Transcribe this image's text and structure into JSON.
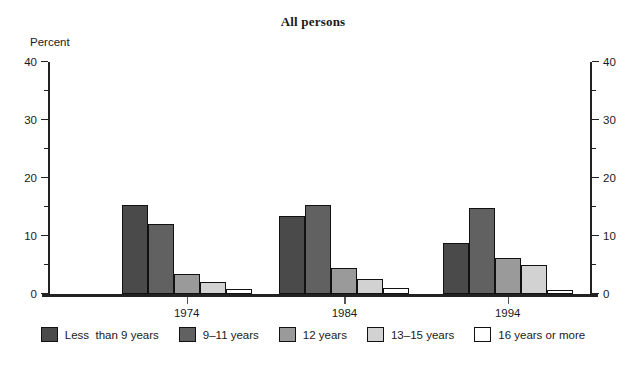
{
  "chart_data": {
    "type": "bar",
    "title": "All persons",
    "xlabel": "",
    "ylabel": "Percent",
    "ylim": [
      0,
      40
    ],
    "yticks": [
      0,
      10,
      20,
      30,
      40
    ],
    "yminorticks": [
      5,
      15,
      25,
      35
    ],
    "grid": false,
    "legend_position": "bottom",
    "dual_axis": true,
    "right_axis_ticks": [
      0,
      10,
      20,
      30,
      40
    ],
    "categories": [
      "1974",
      "1984",
      "1994"
    ],
    "series": [
      {
        "name": "Less  than 9 years",
        "color": "#4a4a4a",
        "values": [
          15.3,
          13.4,
          8.8
        ]
      },
      {
        "name": "9–11 years",
        "color": "#616161",
        "values": [
          12.1,
          15.3,
          14.8
        ]
      },
      {
        "name": "12 years",
        "color": "#9a9a9a",
        "values": [
          3.5,
          4.5,
          6.2
        ]
      },
      {
        "name": "13–15 years",
        "color": "#d2d2d2",
        "values": [
          2.1,
          2.6,
          5.0
        ]
      },
      {
        "name": "16 years or more",
        "color": "#ffffff",
        "values": [
          0.9,
          1.0,
          0.7
        ]
      }
    ]
  },
  "legend": {
    "items": [
      {
        "label": "Less  than 9 years",
        "color": "#4a4a4a"
      },
      {
        "label": "9–11 years",
        "color": "#616161"
      },
      {
        "label": "12 years",
        "color": "#9a9a9a"
      },
      {
        "label": "13–15 years",
        "color": "#d2d2d2"
      },
      {
        "label": "16 years or more",
        "color": "#ffffff"
      }
    ]
  },
  "axis": {
    "left_labels": [
      "40",
      "30",
      "20",
      "10",
      "0"
    ],
    "right_labels": [
      "40",
      "30",
      "20",
      "10",
      "0"
    ],
    "unit_label": "Percent",
    "category_labels": [
      "1974",
      "1984",
      "1994"
    ]
  }
}
